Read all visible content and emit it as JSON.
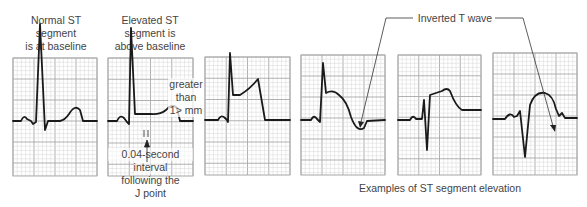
{
  "labels": {
    "normal": [
      "Normal ST",
      "segment",
      "is at baseline"
    ],
    "elevated": [
      "Elevated ST",
      "segment is",
      "above baseline"
    ],
    "greater": [
      "greater",
      "than",
      "1> mm"
    ],
    "interval": [
      "0.04-second",
      "interval",
      "following the",
      "J point"
    ],
    "inverted_t": "Inverted T wave",
    "examples": "Examples of ST segment elevation"
  },
  "colors": {
    "grid_minor": "#d6d6d6",
    "grid_major": "#a8a8a8",
    "trace": "#1a1a1a",
    "text": "#444444"
  },
  "panels": [
    {
      "id": "normal-st",
      "x": 13,
      "y": 58,
      "w": 84,
      "h": 118,
      "baseline": 63,
      "trace": "M0,63 L8,63 Q11,56 14,61 L18,63 L20,66 L23,64 L27,-34 L32,72 L35,63 L47,63 Q52,62 56,56 Q62,46 67,52 L70,63 L84,63"
    },
    {
      "id": "elevated-st",
      "x": 108,
      "y": 58,
      "w": 85,
      "h": 118,
      "baseline": 63,
      "trace": "M0,63 L9,63 Q12,56 16,60 L19,64 L21,66 L23,-30 L27,56 L42,56 Q52,57 58,52 Q64,45 69,50 L72,63 L85,63"
    },
    {
      "id": "example-1",
      "x": 205,
      "y": 57,
      "w": 85,
      "h": 118,
      "baseline": 63,
      "trace": "M0,63 L13,63 Q16,57 20,61 L22,63 L23,65 L25,-4 L28,38 L35,38 Q45,32 53,22 L60,63 L85,63"
    },
    {
      "id": "example-2",
      "x": 301,
      "y": 55,
      "w": 84,
      "h": 120,
      "baseline": 65,
      "trace": "M0,65 L10,65 Q13,59 16,64 L19,67 L22,8 L25,38 Q32,34 38,40 Q46,46 50,62 Q56,78 63,73 L66,66 L84,65"
    },
    {
      "id": "example-3",
      "x": 398,
      "y": 55,
      "w": 83,
      "h": 120,
      "baseline": 65,
      "trace": "M0,65 L12,65 Q15,59 18,64 L24,64 L26,45 L29,95 L32,40 Q38,38 44,36 Q49,32 52,36 Q58,52 64,55 L83,55"
    },
    {
      "id": "example-4",
      "x": 493,
      "y": 53,
      "w": 84,
      "h": 122,
      "baseline": 66,
      "trace": "M0,66 L12,66 Q17,58 21,64 L24,63 L27,58 L32,104 L37,52 Q42,38 52,40 Q60,42 63,56 L66,63 L69,60 L72,65 L84,65"
    }
  ]
}
